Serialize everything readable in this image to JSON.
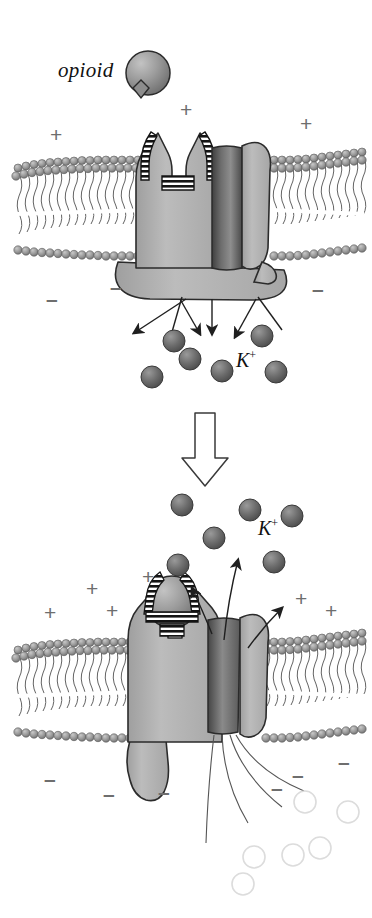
{
  "figure": {
    "panels": [
      {
        "id": "panel-top",
        "state_label": "unbound receptor, channel closed",
        "ion_label": "K",
        "ion_charge": "+",
        "ligand_label": "opioid"
      },
      {
        "id": "panel-bottom",
        "state_label": "opioid bound, channel open, K+ efflux",
        "ion_label": "K",
        "ion_charge": "+"
      }
    ]
  },
  "labels": {
    "opioid": "opioid",
    "potassium": "K",
    "potassium_superscript": "+",
    "plus_sign": "+",
    "minus_sign": "–"
  },
  "colors": {
    "membrane_head": "#9a9a9a",
    "membrane_head_dark": "#6f6f6f",
    "protein_fill": "#b3b3b3",
    "protein_stroke": "#3a3a3a",
    "channel_dark": "#5e5e5e",
    "ion_fill": "#6b6b6b",
    "ion_empty_stroke": "#d8d8d8",
    "charge_gray": "#6e6e6e",
    "outline": "#2b2b2b",
    "background": "#ffffff"
  },
  "top_panel": {
    "charges_plus": [
      {
        "x": 50,
        "y": 124
      },
      {
        "x": 180,
        "y": 99
      },
      {
        "x": 300,
        "y": 113
      }
    ],
    "charges_minus": [
      {
        "x": 46,
        "y": 288
      },
      {
        "x": 110,
        "y": 276
      },
      {
        "x": 312,
        "y": 278
      }
    ],
    "ions": [
      {
        "x": 174,
        "y": 341
      },
      {
        "x": 190,
        "y": 359
      },
      {
        "x": 152,
        "y": 377
      },
      {
        "x": 222,
        "y": 371
      },
      {
        "x": 262,
        "y": 336
      },
      {
        "x": 276,
        "y": 372
      }
    ],
    "ion_label_pos": {
      "x": 236,
      "y": 372
    },
    "ligand_pos": {
      "x": 148,
      "y": 73
    },
    "ligand_label_pos": {
      "x": 58,
      "y": 82
    }
  },
  "bottom_panel": {
    "charges_plus": [
      {
        "x": 44,
        "y": 602
      },
      {
        "x": 86,
        "y": 578
      },
      {
        "x": 106,
        "y": 600
      },
      {
        "x": 142,
        "y": 566
      },
      {
        "x": 295,
        "y": 588
      },
      {
        "x": 325,
        "y": 600
      }
    ],
    "charges_minus": [
      {
        "x": 44,
        "y": 768
      },
      {
        "x": 103,
        "y": 783
      },
      {
        "x": 158,
        "y": 781
      },
      {
        "x": 271,
        "y": 777
      },
      {
        "x": 292,
        "y": 764
      },
      {
        "x": 338,
        "y": 751
      }
    ],
    "ions_out": [
      {
        "x": 182,
        "y": 505
      },
      {
        "x": 214,
        "y": 538
      },
      {
        "x": 178,
        "y": 565
      },
      {
        "x": 250,
        "y": 510
      },
      {
        "x": 292,
        "y": 516
      },
      {
        "x": 274,
        "y": 562
      }
    ],
    "ion_label_pos": {
      "x": 258,
      "y": 540
    },
    "ions_empty": [
      {
        "x": 254,
        "y": 857
      },
      {
        "x": 293,
        "y": 855
      },
      {
        "x": 305,
        "y": 802
      },
      {
        "x": 320,
        "y": 848
      },
      {
        "x": 243,
        "y": 884
      },
      {
        "x": 348,
        "y": 812
      }
    ]
  },
  "transition_arrow": {
    "direction": "down",
    "x": 205,
    "y_top": 413,
    "y_bottom": 483
  }
}
